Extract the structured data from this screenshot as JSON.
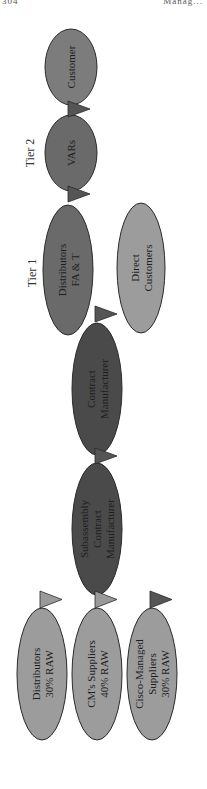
{
  "header": {
    "page_number": "304",
    "running_head": "Manag..."
  },
  "diagram": {
    "colors": {
      "dark": "#4a4a4a",
      "medium": "#6a6a6a",
      "medium_light": "#7c7c7c",
      "light": "#9c9c9c",
      "flag_dark": "#555555",
      "flag_light": "#9a9a9a",
      "outline": "#2a2a2a"
    },
    "tiers": [
      {
        "id": "tier2",
        "label": "Tier 2"
      },
      {
        "id": "tier1",
        "label": "Tier 1"
      }
    ],
    "nodes": [
      {
        "id": "customer",
        "lines": [
          "Customer"
        ],
        "shade": "medium_light"
      },
      {
        "id": "vars",
        "lines": [
          "VARs"
        ],
        "shade": "medium"
      },
      {
        "id": "distributors-fat",
        "lines": [
          "Distributors",
          "FA & T"
        ],
        "shade": "medium"
      },
      {
        "id": "direct-customers",
        "lines": [
          "Direct",
          "Customers"
        ],
        "shade": "light"
      },
      {
        "id": "contract-manufacturer",
        "lines": [
          "Contract",
          "Manufacturer"
        ],
        "shade": "dark"
      },
      {
        "id": "subassembly-cm",
        "lines": [
          "Subassembly",
          "Contract",
          "Manufacturer"
        ],
        "shade": "dark"
      },
      {
        "id": "distributors-raw",
        "lines": [
          "Distributors",
          "30% RAW"
        ],
        "shade": "light"
      },
      {
        "id": "cms-suppliers",
        "lines": [
          "CM's Suppliers",
          "40% RAW"
        ],
        "shade": "light"
      },
      {
        "id": "cisco-managed-suppliers",
        "lines": [
          "Cisco-Managed",
          "Suppliers",
          "30% RAW"
        ],
        "shade": "light"
      }
    ],
    "flags": [
      {
        "id": "flag-vars-customer",
        "shade": "flag_dark"
      },
      {
        "id": "flag-distributors-vars",
        "shade": "flag_dark"
      },
      {
        "id": "flag-cm-distributors",
        "shade": "flag_dark"
      },
      {
        "id": "flag-subassembly-cm",
        "shade": "flag_dark"
      },
      {
        "id": "flag-cms-suppliers-subassembly",
        "shade": "flag_light"
      },
      {
        "id": "flag-distributors-raw",
        "shade": "flag_light"
      },
      {
        "id": "flag-cisco-managed",
        "shade": "flag_dark"
      }
    ]
  }
}
